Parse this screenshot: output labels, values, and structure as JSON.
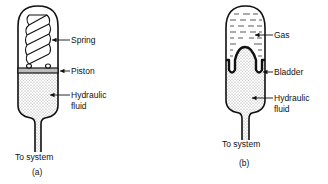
{
  "figure_a": {
    "caption": "(a)",
    "outlet_label": "To system",
    "labels": {
      "spring": "Spring",
      "piston": "Piston",
      "fluid_line1": "Hydraulic",
      "fluid_line2": "fluid"
    }
  },
  "figure_b": {
    "caption": "(b)",
    "outlet_label": "To system",
    "labels": {
      "gas": "Gas",
      "bladder": "Bladder",
      "fluid_line1": "Hydraulic",
      "fluid_line2": "fluid"
    }
  },
  "colors": {
    "ink": "#111111",
    "stipple": "#9a9a9a",
    "piston_fill": "#bdbdbd",
    "background": "#ffffff"
  }
}
